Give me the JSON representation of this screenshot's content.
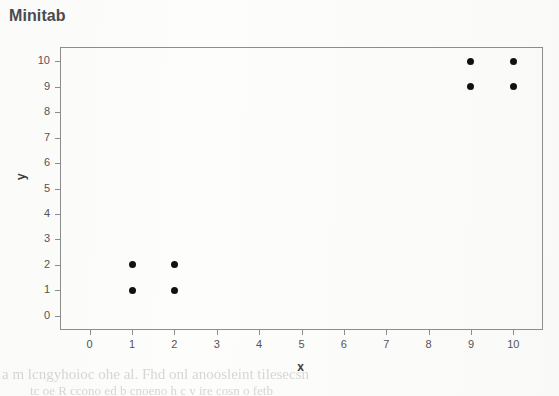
{
  "title": "Minitab",
  "axes": {
    "xlabel": "x",
    "ylabel": "y"
  },
  "artifacts": {
    "note": "faint scanned-page bleed-through, illegible",
    "lines": [
      "a m lcngyhoioc ohe al. Fhd onl anoosleint tilesecsn",
      "tc oe R ccono ed b cnoeno h c v ire cosn o fetb"
    ]
  },
  "chart_data": {
    "type": "scatter",
    "title": "Minitab",
    "xlabel": "x",
    "ylabel": "y",
    "xlim": [
      -0.7,
      10.7
    ],
    "ylim": [
      -0.55,
      10.55
    ],
    "grid": false,
    "legend": null,
    "xticks": [
      0,
      1,
      2,
      3,
      4,
      5,
      6,
      7,
      8,
      9,
      10
    ],
    "yticks": [
      0,
      1,
      2,
      3,
      4,
      5,
      6,
      7,
      8,
      9,
      10
    ],
    "marker": "filled-circle",
    "marker_color": "#111111",
    "series": [
      {
        "name": "data",
        "points": [
          {
            "x": 1,
            "y": 1
          },
          {
            "x": 1,
            "y": 2
          },
          {
            "x": 2,
            "y": 1
          },
          {
            "x": 2,
            "y": 2
          },
          {
            "x": 9,
            "y": 9
          },
          {
            "x": 9,
            "y": 10
          },
          {
            "x": 10,
            "y": 9
          },
          {
            "x": 10,
            "y": 10
          }
        ]
      }
    ]
  }
}
